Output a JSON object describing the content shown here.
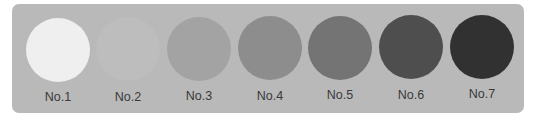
{
  "panel": {
    "background": "#b9b9b9"
  },
  "swatches": [
    {
      "label": "No.1",
      "color": "#efefef"
    },
    {
      "label": "No.2",
      "color": "#bdbdbd"
    },
    {
      "label": "No.3",
      "color": "#a3a3a3"
    },
    {
      "label": "No.4",
      "color": "#8d8d8d"
    },
    {
      "label": "No.5",
      "color": "#747474"
    },
    {
      "label": "No.6",
      "color": "#4e4e4e"
    },
    {
      "label": "No.7",
      "color": "#313131"
    }
  ]
}
